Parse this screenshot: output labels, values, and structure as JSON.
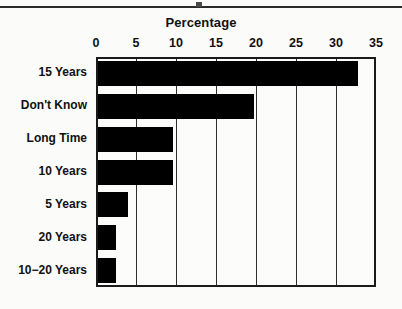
{
  "chart_data": {
    "type": "bar",
    "orientation": "horizontal",
    "title": "Percentage",
    "xlabel": "",
    "ylabel": "",
    "categories": [
      "15 Years",
      "Don't Know",
      "Long Time",
      "10 Years",
      "5 Years",
      "20 Years",
      "10−20 Years"
    ],
    "values": [
      32.5,
      19.5,
      9.4,
      9.4,
      3.7,
      2.2,
      2.2
    ],
    "xlim": [
      0,
      35
    ],
    "xticks": [
      0,
      5,
      10,
      15,
      20,
      25,
      30,
      35
    ],
    "xtick_labels": [
      "0",
      "5",
      "10",
      "15",
      "20",
      "25",
      "30",
      "35"
    ],
    "grid": true,
    "grid_axis": "x",
    "legend": null,
    "bar_color": "#000000",
    "frame_color": "#1a1a1a",
    "background_color": "#fcfcfa"
  },
  "figure": {
    "title": "Percentage"
  }
}
